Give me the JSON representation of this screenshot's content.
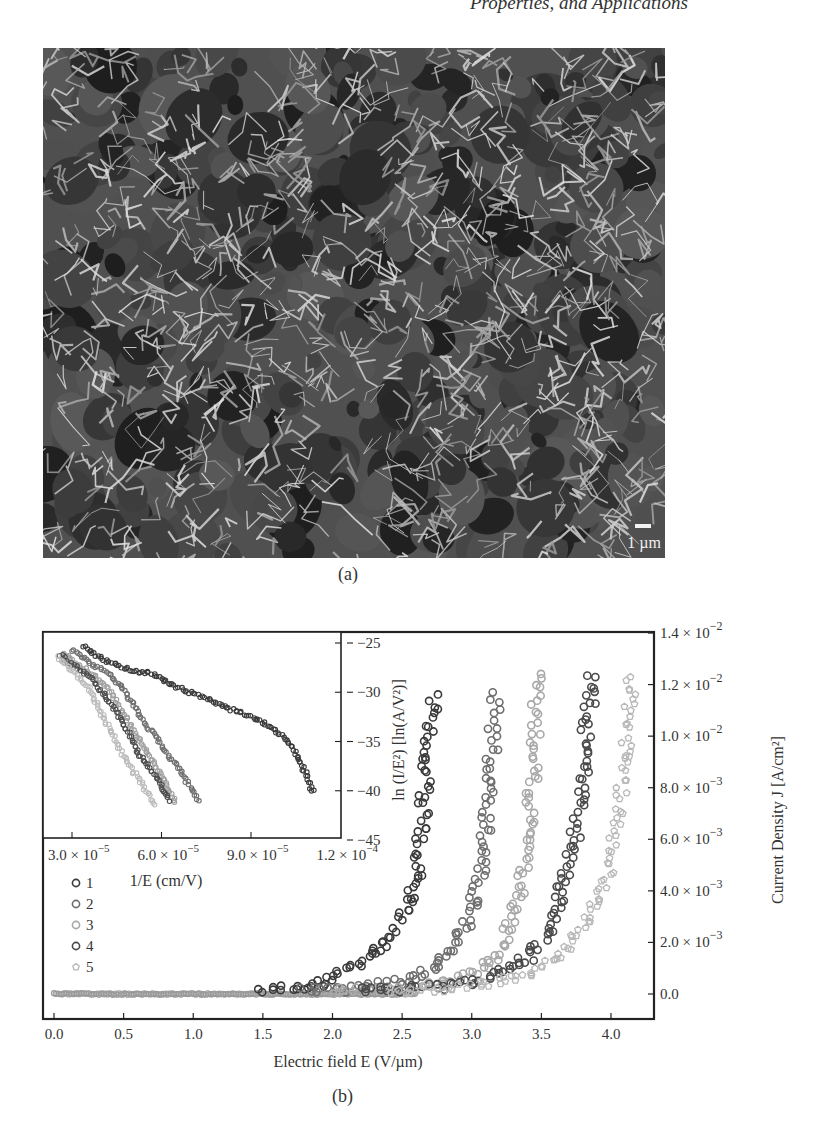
{
  "header": {
    "running_text": "Properties, and Applications"
  },
  "figure_a": {
    "label": "(a)",
    "image_description": "SEM micrograph of dense vertically oriented graphene nanosheets (petal-like network)",
    "scale_bar_label": "1 µm"
  },
  "figure_b": {
    "label": "(b)"
  },
  "chart_data": [
    {
      "name": "main",
      "type": "scatter",
      "title": "",
      "xlabel": "Electric field E (V/µm)",
      "ylabel": "Current Density J [A/cm²]",
      "xlim": [
        -0.08,
        4.3
      ],
      "ylim": [
        -0.00097,
        0.014
      ],
      "x_ticks": [
        0.0,
        0.5,
        1.0,
        1.5,
        2.0,
        2.5,
        3.0,
        3.5,
        4.0
      ],
      "x_tick_labels": [
        "0.0",
        "0.5",
        "1.0",
        "1.5",
        "2.0",
        "2.5",
        "3.0",
        "3.5",
        "4.0"
      ],
      "y_ticks": [
        0.0,
        0.002,
        0.004,
        0.006,
        0.008,
        0.01,
        0.012,
        0.014
      ],
      "y_tick_labels": [
        {
          "mant": "0.0",
          "exp": ""
        },
        {
          "mant": "2.0 × 10",
          "exp": "−3"
        },
        {
          "mant": "4.0 × 10",
          "exp": "−3"
        },
        {
          "mant": "6.0 × 10",
          "exp": "−3"
        },
        {
          "mant": "8.0 × 10",
          "exp": "−3"
        },
        {
          "mant": "1.0 × 10",
          "exp": "−2"
        },
        {
          "mant": "1.2 × 10",
          "exp": "−2"
        },
        {
          "mant": "1.4 × 10",
          "exp": "−2"
        }
      ],
      "y_axis_side": "right",
      "grid": false,
      "legend_position": "left, middle",
      "series": [
        {
          "name": "1",
          "marker": "circle",
          "color": "#3a3a3a",
          "turn_on_field": 1.5,
          "max_field": 2.73,
          "max_current": 0.0118,
          "points": [
            [
              1.5,
              0.0001
            ],
            [
              1.7,
              0.0002
            ],
            [
              1.9,
              0.0004
            ],
            [
              2.0,
              0.0006
            ],
            [
              2.1,
              0.0009
            ],
            [
              2.2,
              0.0012
            ],
            [
              2.3,
              0.0016
            ],
            [
              2.4,
              0.0022
            ],
            [
              2.45,
              0.0026
            ],
            [
              2.5,
              0.003
            ],
            [
              2.55,
              0.0036
            ],
            [
              2.6,
              0.0044
            ],
            [
              2.62,
              0.0052
            ],
            [
              2.64,
              0.0062
            ],
            [
              2.66,
              0.0078
            ],
            [
              2.68,
              0.009
            ],
            [
              2.7,
              0.0098
            ],
            [
              2.72,
              0.0108
            ],
            [
              2.73,
              0.0118
            ]
          ]
        },
        {
          "name": "2",
          "marker": "circle",
          "color": "#6e6e6e",
          "turn_on_field": 1.8,
          "max_field": 3.17,
          "max_current": 0.0118,
          "points": [
            [
              1.8,
              0.0001
            ],
            [
              2.2,
              0.0002
            ],
            [
              2.5,
              0.0005
            ],
            [
              2.7,
              0.0009
            ],
            [
              2.8,
              0.0013
            ],
            [
              2.9,
              0.002
            ],
            [
              2.95,
              0.0026
            ],
            [
              3.0,
              0.0034
            ],
            [
              3.05,
              0.0044
            ],
            [
              3.08,
              0.0054
            ],
            [
              3.1,
              0.0064
            ],
            [
              3.12,
              0.0076
            ],
            [
              3.14,
              0.0088
            ],
            [
              3.15,
              0.0098
            ],
            [
              3.16,
              0.0108
            ],
            [
              3.17,
              0.0118
            ]
          ]
        },
        {
          "name": "3",
          "marker": "circle",
          "color": "#a8a8a8",
          "turn_on_field": 2.0,
          "max_field": 3.48,
          "max_current": 0.0125,
          "points": [
            [
              2.0,
              0.0001
            ],
            [
              2.5,
              0.0002
            ],
            [
              2.8,
              0.0004
            ],
            [
              3.0,
              0.0007
            ],
            [
              3.1,
              0.001
            ],
            [
              3.2,
              0.0016
            ],
            [
              3.25,
              0.0022
            ],
            [
              3.3,
              0.003
            ],
            [
              3.35,
              0.004
            ],
            [
              3.38,
              0.005
            ],
            [
              3.4,
              0.006
            ],
            [
              3.42,
              0.0072
            ],
            [
              3.44,
              0.0086
            ],
            [
              3.45,
              0.0098
            ],
            [
              3.46,
              0.011
            ],
            [
              3.47,
              0.012
            ],
            [
              3.48,
              0.0125
            ]
          ]
        },
        {
          "name": "4",
          "marker": "circle",
          "color": "#4a4a4a",
          "turn_on_field": 2.2,
          "max_field": 3.87,
          "max_current": 0.0125,
          "points": [
            [
              2.2,
              0.0001
            ],
            [
              2.8,
              0.0003
            ],
            [
              3.1,
              0.0006
            ],
            [
              3.3,
              0.001
            ],
            [
              3.45,
              0.0016
            ],
            [
              3.55,
              0.0024
            ],
            [
              3.6,
              0.0032
            ],
            [
              3.65,
              0.0042
            ],
            [
              3.7,
              0.0052
            ],
            [
              3.74,
              0.0062
            ],
            [
              3.77,
              0.0074
            ],
            [
              3.8,
              0.0088
            ],
            [
              3.82,
              0.0098
            ],
            [
              3.84,
              0.011
            ],
            [
              3.86,
              0.012
            ],
            [
              3.87,
              0.0125
            ]
          ]
        },
        {
          "name": "5",
          "marker": "pentagon",
          "color": "#b8b8b8",
          "turn_on_field": 2.4,
          "max_field": 4.15,
          "max_current": 0.0125,
          "points": [
            [
              2.4,
              0.0001
            ],
            [
              3.0,
              0.0003
            ],
            [
              3.3,
              0.0006
            ],
            [
              3.5,
              0.001
            ],
            [
              3.65,
              0.0016
            ],
            [
              3.75,
              0.0022
            ],
            [
              3.85,
              0.003
            ],
            [
              3.92,
              0.0038
            ],
            [
              3.98,
              0.0048
            ],
            [
              4.02,
              0.0058
            ],
            [
              4.05,
              0.0068
            ],
            [
              4.08,
              0.008
            ],
            [
              4.1,
              0.0092
            ],
            [
              4.12,
              0.0104
            ],
            [
              4.14,
              0.0116
            ],
            [
              4.15,
              0.0125
            ]
          ]
        }
      ]
    },
    {
      "name": "inset",
      "type": "scatter",
      "title": "",
      "xlabel": "1/E (cm/V)",
      "ylabel": "ln (I/E²) [ln(A/V²)]",
      "xlim": [
        2e-05,
        0.00012
      ],
      "ylim": [
        -44.8,
        -24.3
      ],
      "x_ticks": [
        3e-05,
        6e-05,
        9e-05,
        0.00012
      ],
      "x_tick_labels": [
        {
          "mant": "3.0 × 10",
          "exp": "−5"
        },
        {
          "mant": "6.0 × 10",
          "exp": "−5"
        },
        {
          "mant": "9.0 × 10",
          "exp": "−5"
        },
        {
          "mant": "1.2 × 10",
          "exp": "−4"
        }
      ],
      "y_ticks": [
        -25,
        -30,
        -35,
        -40,
        -45
      ],
      "y_tick_labels": [
        "−25",
        "−30",
        "−35",
        "−40",
        "−45"
      ],
      "y_axis_side": "right",
      "grid": false,
      "series": [
        {
          "name": "1",
          "color": "#3a3a3a",
          "points": [
            [
              3.4e-05,
              -25.3
            ],
            [
              4e-05,
              -26.6
            ],
            [
              5e-05,
              -27.8
            ],
            [
              5.8e-05,
              -28.2
            ],
            [
              6.5e-05,
              -29.5
            ],
            [
              7.5e-05,
              -30.6
            ],
            [
              8.2e-05,
              -31.6
            ],
            [
              9e-05,
              -32.4
            ],
            [
              9.8e-05,
              -33.8
            ],
            [
              0.000104,
              -35.6
            ],
            [
              0.000108,
              -38.0
            ],
            [
              0.000111,
              -40.3
            ]
          ]
        },
        {
          "name": "2",
          "color": "#707070",
          "points": [
            [
              3e-05,
              -25.7
            ],
            [
              3.6e-05,
              -27.0
            ],
            [
              4.2e-05,
              -28.0
            ],
            [
              4.6e-05,
              -29.2
            ],
            [
              5e-05,
              -31.0
            ],
            [
              5.5e-05,
              -33.4
            ],
            [
              6e-05,
              -35.4
            ],
            [
              6.6e-05,
              -37.8
            ],
            [
              7e-05,
              -39.8
            ],
            [
              7.3e-05,
              -41.2
            ]
          ]
        },
        {
          "name": "3",
          "color": "#a0a0a0",
          "points": [
            [
              2.7e-05,
              -26.0
            ],
            [
              3.2e-05,
              -27.2
            ],
            [
              3.8e-05,
              -28.4
            ],
            [
              4.3e-05,
              -30.0
            ],
            [
              4.8e-05,
              -32.6
            ],
            [
              5.3e-05,
              -35.0
            ],
            [
              5.8e-05,
              -37.5
            ],
            [
              6.2e-05,
              -39.6
            ],
            [
              6.5e-05,
              -41.4
            ]
          ]
        },
        {
          "name": "4",
          "color": "#4e4e4e",
          "points": [
            [
              2.6e-05,
              -26.2
            ],
            [
              3.2e-05,
              -27.6
            ],
            [
              3.7e-05,
              -28.8
            ],
            [
              4.1e-05,
              -30.4
            ],
            [
              4.5e-05,
              -32.0
            ],
            [
              4.9e-05,
              -34.2
            ],
            [
              5.3e-05,
              -36.6
            ],
            [
              5.8e-05,
              -38.4
            ],
            [
              6.1e-05,
              -40.0
            ],
            [
              6.3e-05,
              -41.2
            ]
          ]
        },
        {
          "name": "5",
          "color": "#bcbcbc",
          "points": [
            [
              2.5e-05,
              -26.4
            ],
            [
              3e-05,
              -27.8
            ],
            [
              3.5e-05,
              -29.2
            ],
            [
              3.8e-05,
              -31.0
            ],
            [
              4.2e-05,
              -33.4
            ],
            [
              4.6e-05,
              -35.8
            ],
            [
              5e-05,
              -37.8
            ],
            [
              5.4e-05,
              -39.6
            ],
            [
              5.8e-05,
              -41.6
            ]
          ]
        }
      ]
    }
  ]
}
